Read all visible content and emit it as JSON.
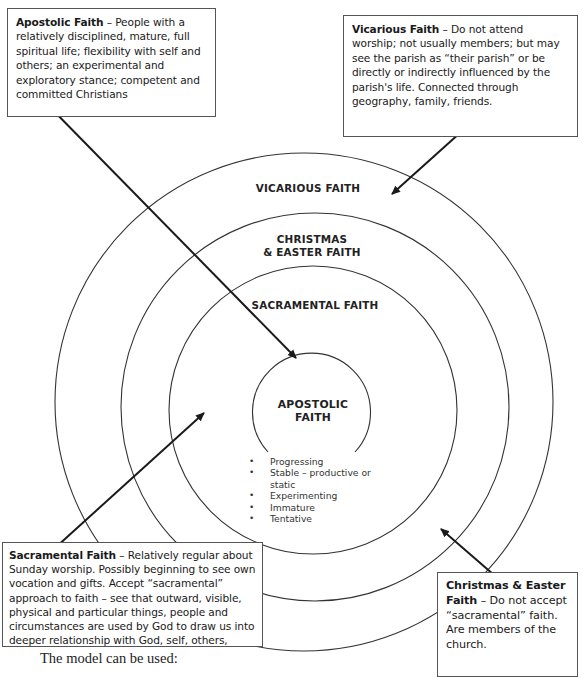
{
  "diagram": {
    "type": "concentric-rings",
    "rings": [
      {
        "id": "vicarious",
        "label": "VICARIOUS FAITH",
        "cx": 304,
        "cy": 402,
        "r": 249
      },
      {
        "id": "christmas-easter",
        "label_line1": "CHRISTMAS",
        "label_line2": "& EASTER FAITH",
        "cx": 315,
        "cy": 407,
        "r": 194
      },
      {
        "id": "sacramental",
        "label": "SACRAMENTAL FAITH",
        "cx": 313,
        "cy": 410,
        "r": 144
      },
      {
        "id": "apostolic",
        "label_line1": "APOSTOLIC",
        "label_line2": "FAITH",
        "cx": 311,
        "cy": 403,
        "r": 59
      }
    ],
    "apostolic_traits": [
      "Progressing",
      "Stable – productive or static",
      "Experimenting",
      "Immature",
      "Tentative"
    ],
    "line_color": "#333333",
    "arrow_color": "#1a1a1a"
  },
  "callouts": {
    "apostolic": {
      "title": "Apostolic Faith",
      "text": " – People with a relatively disciplined, mature, full spiritual life; flexibility with self and others; an experimental and exploratory stance; competent and committed Christians"
    },
    "vicarious": {
      "title": "Vicarious Faith",
      "text": " – Do not attend worship; not usually members; but may see the parish as “their parish” or be directly or indirectly influenced by the parish's life. Connected through geography, family, friends."
    },
    "sacramental": {
      "title": "Sacramental Faith",
      "text": " – Relatively regular about Sunday worship. Possibly beginning to see own vocation and gifts. Accept “sacramental” approach to faith – see that outward, visible, physical and particular things, people and circumstances are used by God to draw us into deeper relationship with God, self, others,"
    },
    "christmas_easter": {
      "title": "Christmas & Easter Faith",
      "text": " – Do not accept “sacramental” faith. Are members of the church."
    }
  },
  "footer": {
    "text": "The model can be used:"
  }
}
